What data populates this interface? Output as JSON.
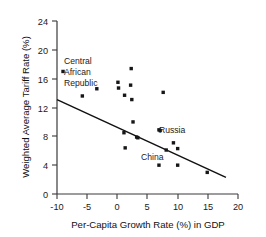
{
  "chart_data": {
    "type": "scatter",
    "title": "",
    "xlabel": "Per-Capita Growth Rate (%) in GDP",
    "ylabel": "Weighted Average Tariff Rate (%)",
    "xlim": [
      -10,
      20
    ],
    "ylim": [
      0,
      24
    ],
    "xticks": [
      -10,
      -5,
      0,
      5,
      10,
      15,
      20
    ],
    "xtick_labels": [
      "-10",
      "-5",
      "0",
      "5",
      "10",
      "15",
      "20"
    ],
    "yticks": [
      0,
      4,
      8,
      12,
      16,
      20,
      24
    ],
    "ytick_labels": [
      "0",
      "4",
      "8",
      "12",
      "16",
      "20",
      "24"
    ],
    "grid": false,
    "legend": false,
    "points": [
      {
        "x": -9.0,
        "y": 17.0,
        "label": "Central African Republic"
      },
      {
        "x": -5.8,
        "y": 13.6,
        "label": ""
      },
      {
        "x": -3.4,
        "y": 14.6,
        "label": ""
      },
      {
        "x": 0.1,
        "y": 15.5,
        "label": ""
      },
      {
        "x": 0.2,
        "y": 14.7,
        "label": ""
      },
      {
        "x": 1.2,
        "y": 13.7,
        "label": ""
      },
      {
        "x": 2.3,
        "y": 17.4,
        "label": ""
      },
      {
        "x": 2.2,
        "y": 15.1,
        "label": ""
      },
      {
        "x": 2.4,
        "y": 13.1,
        "label": ""
      },
      {
        "x": 1.1,
        "y": 8.5,
        "label": ""
      },
      {
        "x": 2.6,
        "y": 10.0,
        "label": ""
      },
      {
        "x": 3.2,
        "y": 7.9,
        "label": ""
      },
      {
        "x": 3.4,
        "y": 7.8,
        "label": ""
      },
      {
        "x": 1.3,
        "y": 6.4,
        "label": ""
      },
      {
        "x": 7.6,
        "y": 14.1,
        "label": ""
      },
      {
        "x": 6.9,
        "y": 8.9,
        "label": "Russia"
      },
      {
        "x": 7.1,
        "y": 8.8,
        "label": ""
      },
      {
        "x": 9.3,
        "y": 7.1,
        "label": ""
      },
      {
        "x": 8.1,
        "y": 6.1,
        "label": "China"
      },
      {
        "x": 10.0,
        "y": 6.3,
        "label": ""
      },
      {
        "x": 6.9,
        "y": 4.0,
        "label": ""
      },
      {
        "x": 10.0,
        "y": 4.0,
        "label": ""
      },
      {
        "x": 14.9,
        "y": 3.0,
        "label": ""
      }
    ],
    "trendline": {
      "x0": -10.0,
      "y0": 13.1,
      "x1": 18.0,
      "y1": 2.3
    }
  },
  "annotations": {
    "central_african_republic": {
      "line1": "Central",
      "line2": "African",
      "line3": "Republic"
    },
    "russia": "Russia",
    "china": "China"
  },
  "colors": {
    "marker": "#161616",
    "axis": "#3a3a3a",
    "trend": "#111111",
    "background": "#ffffff"
  }
}
